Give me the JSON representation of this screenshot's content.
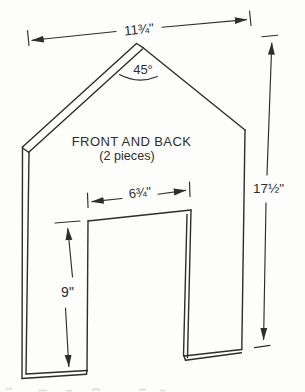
{
  "figure": {
    "type": "woodworking-plan-diagram",
    "part_title": "FRONT AND BACK",
    "part_subtitle": "(2 pieces)",
    "dimensions": {
      "top_width": "11¾\"",
      "roof_angle": "45°",
      "door_width": "6¾\"",
      "overall_height": "17½\"",
      "door_height": "9\""
    },
    "colors": {
      "line": "#2d2d2d",
      "background": "#fdfdfb"
    }
  }
}
